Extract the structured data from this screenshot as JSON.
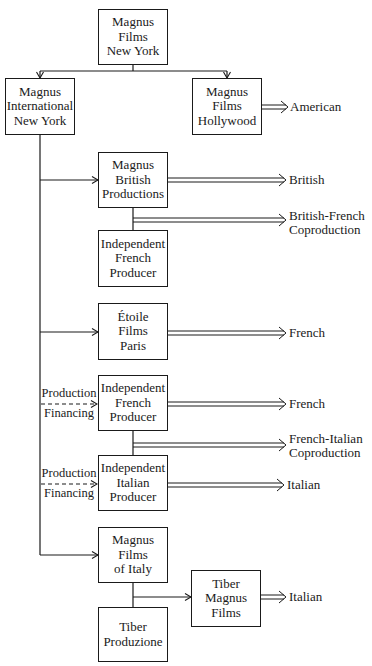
{
  "diagram": {
    "type": "organizational flow chart",
    "nodes": {
      "root": "Magnus\nFilms\nNew York",
      "international": "Magnus\nInternational\nNew York",
      "hollywood": "Magnus\nFilms\nHollywood",
      "british": "Magnus\nBritish\nProductions",
      "indep_french_1": "Independent\nFrench\nProducer",
      "etoile": "Étoile\nFilms\nParis",
      "indep_french_2": "Independent\nFrench\nProducer",
      "indep_italian": "Independent\nItalian\nProducer",
      "magnus_italy": "Magnus\nFilms\nof Italy",
      "tiber_produzione": "Tiber\nProduzione",
      "tiber_magnus": "Tiber\nMagnus\nFilms"
    },
    "outputs": {
      "american": "American",
      "british": "British",
      "british_french": "British-French\nCoproduction",
      "french_1": "French",
      "french_2": "French",
      "french_italian": "French-Italian\nCoproduction",
      "italian_1": "Italian",
      "italian_2": "Italian"
    },
    "side_labels": {
      "pf1_top": "Production",
      "pf1_bottom": "Financing",
      "pf2_top": "Production",
      "pf2_bottom": "Financing"
    },
    "edges": [
      {
        "from": "root",
        "to": "international",
        "style": "single-arrow"
      },
      {
        "from": "root",
        "to": "hollywood",
        "style": "single-arrow"
      },
      {
        "from": "hollywood",
        "to": "American",
        "style": "double-arrow"
      },
      {
        "from": "international",
        "to": "british",
        "style": "single-arrow"
      },
      {
        "from": "british",
        "to": "British",
        "style": "double-arrow"
      },
      {
        "from": "british+indep_french_1",
        "to": "British-French Coproduction",
        "style": "double-arrow"
      },
      {
        "from": "international",
        "to": "etoile",
        "style": "single-arrow"
      },
      {
        "from": "etoile",
        "to": "French",
        "style": "double-arrow"
      },
      {
        "from": "international",
        "to": "indep_french_2",
        "style": "dashed-arrow",
        "label": "Production Financing"
      },
      {
        "from": "indep_french_2",
        "to": "French",
        "style": "double-arrow"
      },
      {
        "from": "indep_french_2+indep_italian",
        "to": "French-Italian Coproduction",
        "style": "double-arrow"
      },
      {
        "from": "international",
        "to": "indep_italian",
        "style": "dashed-arrow",
        "label": "Production Financing"
      },
      {
        "from": "indep_italian",
        "to": "Italian",
        "style": "double-arrow"
      },
      {
        "from": "international",
        "to": "magnus_italy",
        "style": "single-arrow"
      },
      {
        "from": "magnus_italy+tiber_produzione",
        "to": "tiber_magnus",
        "style": "single-arrow"
      },
      {
        "from": "tiber_magnus",
        "to": "Italian",
        "style": "double-arrow"
      }
    ]
  }
}
